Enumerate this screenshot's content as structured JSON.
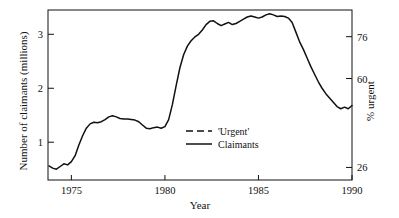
{
  "chart_data": {
    "type": "line",
    "title": "",
    "xlabel": "Year",
    "ylabel": "Number of claimants (millions)",
    "ylabel_right": "% urgent",
    "xlim": [
      1973.75,
      1990
    ],
    "ylim": [
      0.3,
      3.45
    ],
    "ylim_right": [
      21.2,
      86.2
    ],
    "xticks": [
      1975,
      1980,
      1985,
      1990
    ],
    "xticklabels": [
      "1975",
      "1980",
      "1985",
      "1990"
    ],
    "yticks": [
      1,
      2,
      3
    ],
    "yticklabels": [
      "1",
      "2",
      "3"
    ],
    "yticks_right": [
      26,
      60,
      76
    ],
    "yticklabels_right": [
      "26",
      "60",
      "76"
    ],
    "grid": false,
    "legend_position": "center",
    "series": [
      {
        "name": "'Urgent'",
        "style": "dashed",
        "axis": "right",
        "color": "#111111",
        "x": [
          1973.8,
          1974.0,
          1974.2,
          1974.4,
          1974.6,
          1974.8,
          1975.0,
          1975.2,
          1975.4,
          1975.6,
          1975.8,
          1976.0,
          1976.2,
          1976.4,
          1976.6,
          1976.8,
          1977.0,
          1977.2,
          1977.4,
          1977.6,
          1977.8,
          1978.0,
          1978.2,
          1978.4,
          1978.6,
          1978.8,
          1979.0,
          1979.2,
          1979.4,
          1979.6,
          1979.8,
          1980.0,
          1980.2,
          1980.4,
          1980.6,
          1980.8,
          1981.0,
          1981.2,
          1981.4,
          1981.6,
          1981.8,
          1982.0,
          1982.2,
          1982.4,
          1982.6,
          1982.8,
          1983.0,
          1983.2,
          1983.4,
          1983.6,
          1983.8,
          1984.0,
          1984.2,
          1984.4,
          1984.6,
          1984.8,
          1985.0,
          1985.2,
          1985.4,
          1985.6,
          1985.8,
          1986.0,
          1986.2,
          1986.4,
          1986.6,
          1986.8,
          1987.0,
          1987.2,
          1987.4,
          1987.6,
          1987.8,
          1988.0,
          1988.2,
          1988.4,
          1988.6,
          1988.8,
          1989.0,
          1989.2,
          1989.4,
          1989.6,
          1989.8,
          1990.0
        ],
        "y": [
          0.47,
          0.42,
          0.4,
          0.43,
          0.5,
          0.48,
          0.58,
          0.72,
          0.95,
          1.22,
          1.52,
          1.7,
          1.74,
          1.7,
          1.67,
          1.62,
          1.57,
          1.58,
          1.63,
          1.7,
          1.8,
          1.88,
          1.9,
          1.85,
          1.72,
          1.52,
          1.34,
          1.27,
          1.25,
          1.24,
          1.21,
          1.22,
          1.55,
          2.1,
          2.62,
          2.92,
          3.03,
          3.01,
          2.99,
          3.04,
          3.12,
          3.2,
          3.24,
          3.25,
          3.22,
          3.17,
          3.14,
          3.15,
          3.16,
          3.12,
          2.98,
          2.88,
          2.98,
          3.1,
          3.18,
          3.22,
          3.24,
          3.25,
          3.25,
          3.24,
          3.23,
          3.24,
          3.25,
          3.24,
          3.2,
          3.1,
          2.92,
          2.62,
          2.36,
          2.22,
          2.14,
          2.0,
          1.82,
          1.66,
          1.5,
          1.36,
          1.22,
          1.08,
          0.97,
          0.92,
          0.94,
          1.0
        ]
      },
      {
        "name": "Claimants",
        "style": "solid",
        "axis": "left",
        "color": "#111111",
        "x": [
          1973.8,
          1974.0,
          1974.2,
          1974.4,
          1974.6,
          1974.8,
          1975.0,
          1975.2,
          1975.4,
          1975.6,
          1975.8,
          1976.0,
          1976.2,
          1976.4,
          1976.6,
          1976.8,
          1977.0,
          1977.2,
          1977.4,
          1977.6,
          1977.8,
          1978.0,
          1978.2,
          1978.4,
          1978.6,
          1978.8,
          1979.0,
          1979.2,
          1979.4,
          1979.6,
          1979.8,
          1980.0,
          1980.2,
          1980.4,
          1980.6,
          1980.8,
          1981.0,
          1981.2,
          1981.4,
          1981.6,
          1981.8,
          1982.0,
          1982.2,
          1982.4,
          1982.6,
          1982.8,
          1983.0,
          1983.2,
          1983.4,
          1983.6,
          1983.8,
          1984.0,
          1984.2,
          1984.4,
          1984.6,
          1984.8,
          1985.0,
          1985.2,
          1985.4,
          1985.6,
          1985.8,
          1986.0,
          1986.2,
          1986.4,
          1986.6,
          1986.8,
          1987.0,
          1987.2,
          1987.4,
          1987.6,
          1987.8,
          1988.0,
          1988.2,
          1988.4,
          1988.6,
          1988.8,
          1989.0,
          1989.2,
          1989.4,
          1989.6,
          1989.8,
          1990.0
        ],
        "y": [
          0.56,
          0.52,
          0.5,
          0.55,
          0.6,
          0.58,
          0.64,
          0.75,
          0.95,
          1.12,
          1.26,
          1.34,
          1.37,
          1.36,
          1.38,
          1.42,
          1.47,
          1.49,
          1.47,
          1.44,
          1.43,
          1.43,
          1.42,
          1.41,
          1.38,
          1.32,
          1.26,
          1.25,
          1.27,
          1.28,
          1.26,
          1.29,
          1.42,
          1.7,
          2.05,
          2.38,
          2.62,
          2.78,
          2.88,
          2.95,
          3.0,
          3.08,
          3.18,
          3.24,
          3.25,
          3.2,
          3.16,
          3.19,
          3.22,
          3.18,
          3.2,
          3.24,
          3.28,
          3.32,
          3.34,
          3.32,
          3.3,
          3.32,
          3.36,
          3.38,
          3.36,
          3.33,
          3.34,
          3.33,
          3.3,
          3.22,
          3.04,
          2.86,
          2.72,
          2.56,
          2.4,
          2.26,
          2.12,
          2.0,
          1.9,
          1.82,
          1.74,
          1.66,
          1.62,
          1.65,
          1.62,
          1.68
        ]
      }
    ],
    "legend": [
      {
        "label": "'Urgent'",
        "style": "dashed"
      },
      {
        "label": "Claimants",
        "style": "solid"
      }
    ]
  }
}
